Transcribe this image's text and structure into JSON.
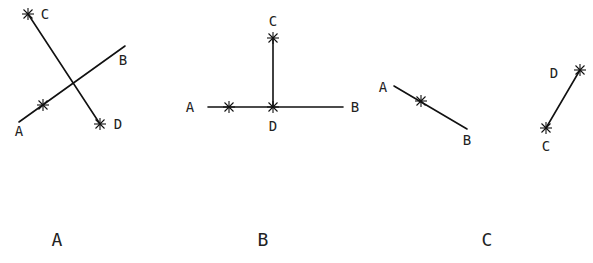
{
  "panels": [
    {
      "caption": "A",
      "points": {
        "A": "A",
        "B": "B",
        "C": "C",
        "D": "D"
      },
      "description": "Segment CD crosses segment AB; star markers at C, D and one point on AB"
    },
    {
      "caption": "B",
      "points": {
        "A": "A",
        "B": "B",
        "C": "C",
        "D": "D"
      },
      "description": "Horizontal segment AB with perpendicular segment DC rising from D; star markers at C, D and a point on AD"
    },
    {
      "caption": "C",
      "points": {
        "A": "A",
        "B": "B",
        "C": "C",
        "D": "D"
      },
      "description": "Separate segments AB and CD that do not intersect; star markers on AB, at C and at D"
    }
  ]
}
